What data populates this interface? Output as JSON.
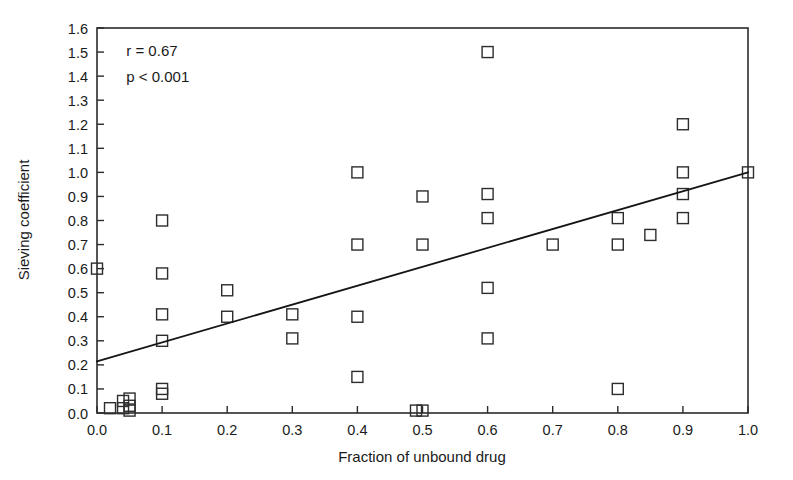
{
  "chart_data": {
    "type": "scatter",
    "title": "",
    "xlabel": "Fraction of unbound drug",
    "ylabel": "Sieving coefficient",
    "xlim": [
      0.0,
      1.0
    ],
    "ylim": [
      0.0,
      1.6
    ],
    "xticks": [
      "0.0",
      "0.1",
      "0.2",
      "0.3",
      "0.4",
      "0.5",
      "0.6",
      "0.7",
      "0.8",
      "0.9",
      "1.0"
    ],
    "xtick_values": [
      0.0,
      0.1,
      0.2,
      0.3,
      0.4,
      0.5,
      0.6,
      0.7,
      0.8,
      0.9,
      1.0
    ],
    "yticks": [
      "0.0",
      "0.1",
      "0.2",
      "0.3",
      "0.4",
      "0.5",
      "0.6",
      "0.7",
      "0.8",
      "0.9",
      "1.0",
      "1.1",
      "1.2",
      "1.3",
      "1.4",
      "1.5",
      "1.6"
    ],
    "ytick_values": [
      0.0,
      0.1,
      0.2,
      0.3,
      0.4,
      0.5,
      0.6,
      0.7,
      0.8,
      0.9,
      1.0,
      1.1,
      1.2,
      1.3,
      1.4,
      1.5,
      1.6
    ],
    "grid": false,
    "legend": null,
    "marker_style": "open-square",
    "marker_color": "#2d2d2d",
    "points": [
      {
        "x": 0.0,
        "y": 0.6
      },
      {
        "x": 0.02,
        "y": 0.02
      },
      {
        "x": 0.04,
        "y": 0.05
      },
      {
        "x": 0.04,
        "y": 0.02
      },
      {
        "x": 0.05,
        "y": 0.06
      },
      {
        "x": 0.05,
        "y": 0.03
      },
      {
        "x": 0.05,
        "y": 0.01
      },
      {
        "x": 0.1,
        "y": 0.8
      },
      {
        "x": 0.1,
        "y": 0.58
      },
      {
        "x": 0.1,
        "y": 0.41
      },
      {
        "x": 0.1,
        "y": 0.3
      },
      {
        "x": 0.1,
        "y": 0.1
      },
      {
        "x": 0.1,
        "y": 0.08
      },
      {
        "x": 0.2,
        "y": 0.51
      },
      {
        "x": 0.2,
        "y": 0.4
      },
      {
        "x": 0.3,
        "y": 0.41
      },
      {
        "x": 0.3,
        "y": 0.31
      },
      {
        "x": 0.4,
        "y": 1.0
      },
      {
        "x": 0.4,
        "y": 0.7
      },
      {
        "x": 0.4,
        "y": 0.4
      },
      {
        "x": 0.4,
        "y": 0.15
      },
      {
        "x": 0.49,
        "y": 0.01
      },
      {
        "x": 0.5,
        "y": 0.9
      },
      {
        "x": 0.5,
        "y": 0.7
      },
      {
        "x": 0.5,
        "y": 0.01
      },
      {
        "x": 0.6,
        "y": 1.5
      },
      {
        "x": 0.6,
        "y": 0.91
      },
      {
        "x": 0.6,
        "y": 0.81
      },
      {
        "x": 0.6,
        "y": 0.52
      },
      {
        "x": 0.6,
        "y": 0.31
      },
      {
        "x": 0.7,
        "y": 0.7
      },
      {
        "x": 0.8,
        "y": 0.81
      },
      {
        "x": 0.8,
        "y": 0.7
      },
      {
        "x": 0.8,
        "y": 0.1
      },
      {
        "x": 0.85,
        "y": 0.74
      },
      {
        "x": 0.9,
        "y": 1.2
      },
      {
        "x": 0.9,
        "y": 1.0
      },
      {
        "x": 0.9,
        "y": 0.91
      },
      {
        "x": 0.9,
        "y": 0.81
      },
      {
        "x": 1.0,
        "y": 1.0
      }
    ],
    "fit_line": {
      "x_start": 0.0,
      "y_start": 0.215,
      "x_end": 1.0,
      "y_end": 1.0
    },
    "annotations": [
      {
        "text": "r = 0.67",
        "x": 0.045,
        "y": 1.505
      },
      {
        "text": "p < 0.001",
        "x": 0.045,
        "y": 1.395
      }
    ]
  }
}
